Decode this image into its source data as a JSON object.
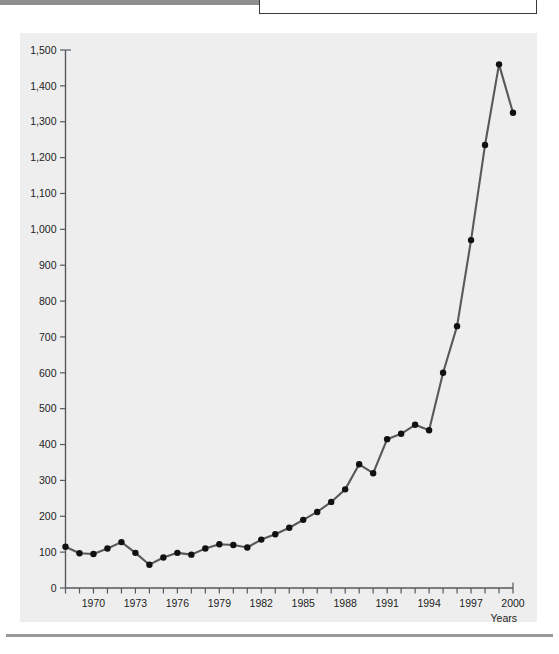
{
  "page": {
    "background_color": "#ffffff",
    "panel_color": "#eeeeee",
    "line_color": "#59595b",
    "dot_color": "#111111",
    "axis_color": "#555a5e"
  },
  "chart_data": {
    "type": "line",
    "title": "",
    "xlabel": "Years",
    "ylabel": "",
    "xlim": [
      1968,
      2000
    ],
    "ylim": [
      0,
      1500
    ],
    "grid": false,
    "legend": null,
    "y_ticks": [
      0,
      100,
      200,
      300,
      400,
      500,
      600,
      700,
      800,
      900,
      1000,
      1100,
      1200,
      1300,
      1400,
      1500
    ],
    "y_tick_labels": [
      "0",
      "100",
      "200",
      "300",
      "400",
      "500",
      "600",
      "700",
      "800",
      "900",
      "1,000",
      "1,100",
      "1,200",
      "1,300",
      "1,400",
      "1,500"
    ],
    "x_ticks": [
      1968,
      1969,
      1970,
      1971,
      1972,
      1973,
      1974,
      1975,
      1976,
      1977,
      1978,
      1979,
      1980,
      1981,
      1982,
      1983,
      1984,
      1985,
      1986,
      1987,
      1988,
      1989,
      1990,
      1991,
      1992,
      1993,
      1994,
      1995,
      1996,
      1997,
      1998,
      1999,
      2000
    ],
    "x_tick_labels": [
      "1970",
      "1973",
      "1976",
      "1979",
      "1982",
      "1985",
      "1988",
      "1991",
      "1994",
      "1997",
      "2000"
    ],
    "x_labeled_years": [
      1970,
      1973,
      1976,
      1979,
      1982,
      1985,
      1988,
      1991,
      1994,
      1997,
      2000
    ],
    "x": [
      1968,
      1969,
      1970,
      1971,
      1972,
      1973,
      1974,
      1975,
      1976,
      1977,
      1978,
      1979,
      1980,
      1981,
      1982,
      1983,
      1984,
      1985,
      1986,
      1987,
      1988,
      1989,
      1990,
      1991,
      1992,
      1993,
      1994,
      1995,
      1996,
      1997,
      1998,
      1999,
      2000
    ],
    "values": [
      115,
      97,
      95,
      110,
      128,
      98,
      65,
      85,
      98,
      93,
      110,
      122,
      120,
      113,
      135,
      150,
      168,
      190,
      212,
      240,
      275,
      345,
      320,
      415,
      430,
      455,
      440,
      600,
      730,
      970,
      1235,
      1460,
      1325
    ],
    "series": [
      {
        "name": "series-1",
        "values": [
          115,
          97,
          95,
          110,
          128,
          98,
          65,
          85,
          98,
          93,
          110,
          122,
          120,
          113,
          135,
          150,
          168,
          190,
          212,
          240,
          275,
          345,
          320,
          415,
          430,
          455,
          440,
          600,
          730,
          970,
          1235,
          1460,
          1325
        ]
      }
    ]
  }
}
